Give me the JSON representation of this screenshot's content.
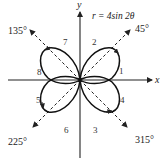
{
  "diagram": {
    "equation": "r = 4sin 2θ",
    "axes": {
      "x_label": "x",
      "y_label": "y"
    },
    "directions": [
      {
        "angle": 45,
        "label": "45°"
      },
      {
        "angle": 135,
        "label": "135°"
      },
      {
        "angle": 225,
        "label": "225°"
      },
      {
        "angle": 315,
        "label": "315°"
      }
    ],
    "petal_segments": [
      "1",
      "2",
      "3",
      "4",
      "5",
      "6",
      "7",
      "8"
    ]
  }
}
